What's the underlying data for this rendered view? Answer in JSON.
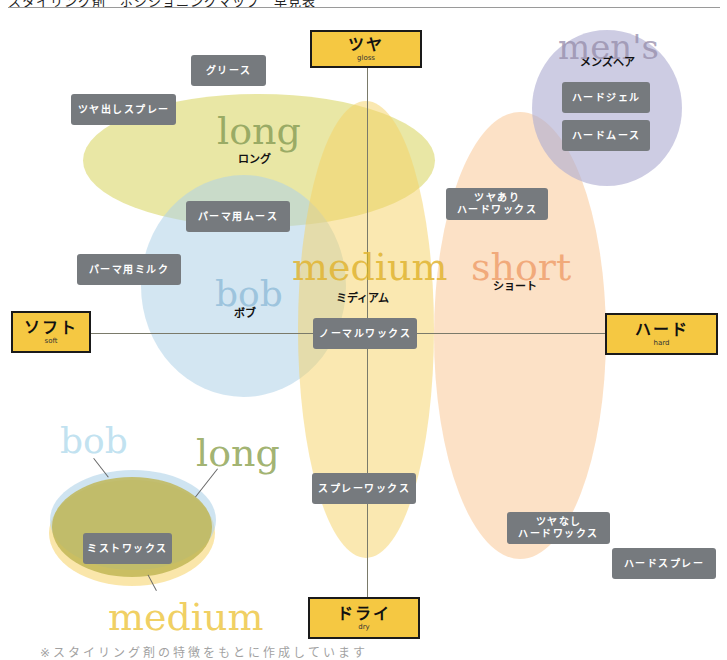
{
  "header": {
    "title_clipped": "スタイリング剤　ポジショニングマップ　早見表"
  },
  "axes": {
    "top": {
      "label": "ツヤ",
      "sub": "gloss"
    },
    "left": {
      "label": "ソフト",
      "sub": "soft"
    },
    "right": {
      "label": "ハード",
      "sub": "hard"
    },
    "bottom": {
      "label": "ドライ",
      "sub": "dry"
    }
  },
  "regions": {
    "long": {
      "en": "long",
      "jp": "ロング",
      "color": "#dcd87a"
    },
    "bob": {
      "en": "bob",
      "jp": "ボブ",
      "color": "#bcd9ec"
    },
    "medium": {
      "en": "medium",
      "jp": "ミディアム",
      "color": "#f3d574"
    },
    "short": {
      "en": "short",
      "jp": "ショート",
      "color": "#f8d2ad"
    },
    "mens": {
      "en": "men's",
      "jp": "メンズヘア",
      "color": "#c6c4dc"
    }
  },
  "products": {
    "grease": "グリース",
    "gloss_spray": "ツヤ出しスプレー",
    "perm_mousse": "パーマ用ムース",
    "perm_milk": "パーマ用ミルク",
    "normal_wax": "ノーマルワックス",
    "spray_wax": "スプレーワックス",
    "gloss_hard_wax": [
      "ツヤあり",
      "ハードワックス"
    ],
    "matte_hard_wax": [
      "ツヤなし",
      "ハードワックス"
    ],
    "hard_spray": "ハードスプレー",
    "hard_gel": "ハードジェル",
    "hard_mousse": "ハードムース",
    "mist_wax": "ミストワックス"
  },
  "legend": {
    "bob": "bob",
    "long": "long",
    "medium": "medium"
  },
  "footer": {
    "text_clipped": "※スタイリング剤の特徴をもとに作成しています"
  }
}
